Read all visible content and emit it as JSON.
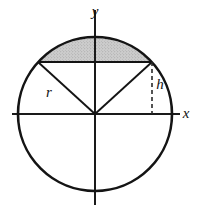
{
  "figure": {
    "background_color": "#ffffff",
    "width": 200,
    "height": 213
  },
  "axes": {
    "x_label": "x",
    "y_label": "y",
    "axis_color": "#1a1a1a",
    "x_axis": {
      "y": 114,
      "x_start": 12,
      "x_end": 180
    },
    "y_axis": {
      "x": 95,
      "y_start": 10,
      "y_end": 205
    },
    "x_label_pos": {
      "x": 186,
      "y": 118
    },
    "y_label_pos": {
      "x": 95,
      "y": 16
    }
  },
  "circle": {
    "center_x": 95,
    "center_y": 114,
    "radius": 77,
    "stroke_color": "#141414",
    "stroke_width": 2.6,
    "fill": "none"
  },
  "chord": {
    "y": 62,
    "x_left": 38,
    "x_right": 152,
    "stroke_color": "#141414",
    "stroke_width": 2.2
  },
  "segment": {
    "name": "shaded-circular-segment",
    "fill_color": "#c9c9c9",
    "stipple_color": "#8f8f8f",
    "description": "region between chord and upper arc"
  },
  "radii": [
    {
      "name": "radius-left",
      "x1": 95,
      "y1": 114,
      "x2": 38,
      "y2": 62
    },
    {
      "name": "radius-right",
      "x1": 95,
      "y1": 114,
      "x2": 152,
      "y2": 62
    }
  ],
  "radius_label": {
    "text": "r",
    "x": 49,
    "y": 97
  },
  "height_line": {
    "name": "segment-height-dashed-line",
    "x": 152,
    "y_top": 62,
    "y_bottom": 114,
    "dash_pattern": "4,3",
    "stroke_color": "#2a2a2a",
    "stroke_width": 1.6
  },
  "height_label": {
    "text": "h",
    "x": 156,
    "y": 89
  }
}
